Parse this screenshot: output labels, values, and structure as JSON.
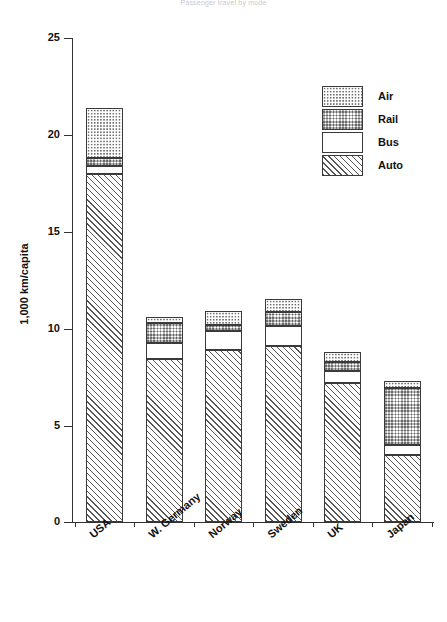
{
  "chart_data": {
    "type": "bar",
    "subtype": "stacked-vertical",
    "title": "Passenger travel by mode",
    "xlabel": "",
    "ylabel": "1,000 km/capita",
    "ylim": [
      0,
      25
    ],
    "yticks": [
      0,
      5,
      10,
      15,
      20,
      25
    ],
    "ytick_labels": [
      "0",
      "5",
      "10",
      "15",
      "20",
      "25"
    ],
    "grid": false,
    "legend_position": "top-right",
    "categories": [
      "USA",
      "W. Germany",
      "Norway",
      "Sweden",
      "UK",
      "Japan"
    ],
    "series": [
      {
        "name": "Auto",
        "pattern": "diagonal-hatch",
        "values": [
          18.0,
          8.4,
          8.9,
          9.1,
          7.2,
          3.45
        ]
      },
      {
        "name": "Bus",
        "pattern": "solid-white",
        "values": [
          0.4,
          0.85,
          0.95,
          1.0,
          0.6,
          0.55
        ]
      },
      {
        "name": "Rail",
        "pattern": "cross-hatch",
        "values": [
          0.4,
          1.05,
          0.35,
          0.75,
          0.45,
          2.9
        ]
      },
      {
        "name": "Air",
        "pattern": "dotted",
        "values": [
          2.6,
          0.3,
          0.7,
          0.65,
          0.55,
          0.4
        ]
      }
    ],
    "totals": [
      21.4,
      10.6,
      10.9,
      11.5,
      8.8,
      7.3
    ]
  },
  "legend": {
    "items": [
      {
        "label": "Air",
        "pattern": "dotted"
      },
      {
        "label": "Rail",
        "pattern": "cross-hatch"
      },
      {
        "label": "Bus",
        "pattern": "solid-white"
      },
      {
        "label": "Auto",
        "pattern": "diagonal-hatch"
      }
    ]
  },
  "axis": {
    "y_title": "1,000 km/capita",
    "y_tick_labels": [
      "25",
      "20",
      "15",
      "10",
      "5",
      "0"
    ],
    "x_tick_labels": [
      "USA",
      "W. Germany",
      "Norway",
      "Sweden",
      "UK",
      "Japan"
    ]
  }
}
